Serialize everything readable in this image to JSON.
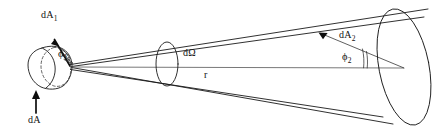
{
  "figure": {
    "background_color": "#ffffff",
    "line_color": "#1a1a1a",
    "labels": {
      "source_area": "dA",
      "projected_area_1_base": "dA",
      "projected_area_1_sub": "1",
      "projected_area_2_base": "dA",
      "projected_area_2_sub": "2",
      "angle_1_base": "ϕ",
      "angle_1_sub": "1",
      "angle_2_base": "ϕ",
      "angle_2_sub": "2",
      "solid_angle": "dΩ",
      "distance": "r"
    },
    "elements": [
      {
        "name": "source-patch",
        "description": "small oblique elliptical surface element at cone apex, left end"
      },
      {
        "name": "dashed-ellipse",
        "description": "dashed ellipse outlining the base of the source patch"
      },
      {
        "name": "cone-body",
        "description": "elongated cone widening from left apex to right base"
      },
      {
        "name": "solid-angle-ellipse",
        "description": "narrow vertical ellipse cross-section marking dΩ along the axis"
      },
      {
        "name": "target-ellipse",
        "description": "large tilted ellipse forming the right-hand cone base"
      },
      {
        "name": "axis-line",
        "description": "horizontal centre line of length r from apex to target centre"
      },
      {
        "name": "normal-vector-1",
        "description": "arrow normal to source patch labelled dA1"
      },
      {
        "name": "normal-vector-2",
        "description": "arrow normal to target patch labelled dA2"
      },
      {
        "name": "source-arrow",
        "description": "upward arrow pointing at source element labelled dA"
      },
      {
        "name": "angle-arc-1",
        "description": "arc between normal-vector-1 and axis marking phi1"
      },
      {
        "name": "angle-arc-2",
        "description": "arc between normal-vector-2 and axis marking phi2"
      }
    ]
  }
}
